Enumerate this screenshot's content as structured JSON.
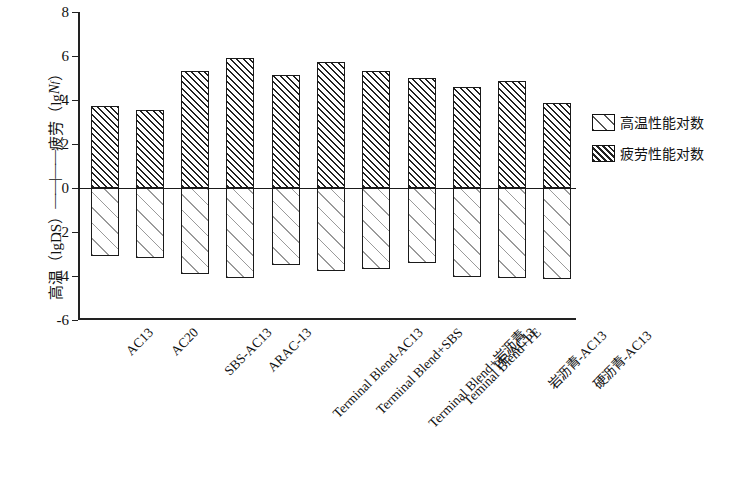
{
  "chart_data": {
    "type": "bar",
    "title": "",
    "subtitle": "",
    "xlabel": "",
    "ylabel_parts": {
      "top_cn": "疲劳",
      "top_unit": "（lg",
      "top_italic": "N",
      "top_sub": "f",
      "top_close": "）",
      "divider": "——|——",
      "bottom_cn": "高温",
      "bottom_unit": "（lgDS）"
    },
    "ylabel": "高温（lgDS）——|—— 疲劳（lgNf）",
    "ylim": [
      -6,
      8
    ],
    "yticks": [
      8,
      6,
      4,
      2,
      0,
      -2,
      -4,
      -6
    ],
    "ytick_labels": [
      "8",
      "6",
      "4",
      "2",
      "0",
      "-2",
      "-4",
      "-6"
    ],
    "grid": false,
    "legend_position": "right",
    "zero_reference": 0,
    "categories": [
      "AC13",
      "AC20",
      "SBS-AC13",
      "ARAC-13",
      "Terminal Blend-AC13",
      "Terminal Blend+SBS",
      "Terminal Blend+岩沥青",
      "Teminal Blend+PE",
      "PE-AC13",
      "岩沥青-AC13",
      "硬沥青-AC13"
    ],
    "series": [
      {
        "name": "疲劳性能对数",
        "hatch": "dense",
        "values": [
          3.75,
          3.55,
          5.3,
          5.9,
          5.15,
          5.75,
          5.3,
          5.0,
          4.6,
          4.85,
          3.85
        ]
      },
      {
        "name": "高温性能对数",
        "hatch": "sparse",
        "values": [
          -3.1,
          -3.2,
          -3.9,
          -4.1,
          -3.5,
          -3.75,
          -3.7,
          -3.4,
          -4.05,
          -4.1,
          -4.15
        ]
      }
    ]
  },
  "legend": {
    "items": [
      {
        "label": "高温性能对数",
        "hatch": "sparse"
      },
      {
        "label": "疲劳性能对数",
        "hatch": "dense"
      }
    ]
  },
  "colors": {
    "axis": "#222222",
    "hatch_dense": "#222222",
    "hatch_sparse": "#9a9a9a",
    "background": "#ffffff"
  }
}
